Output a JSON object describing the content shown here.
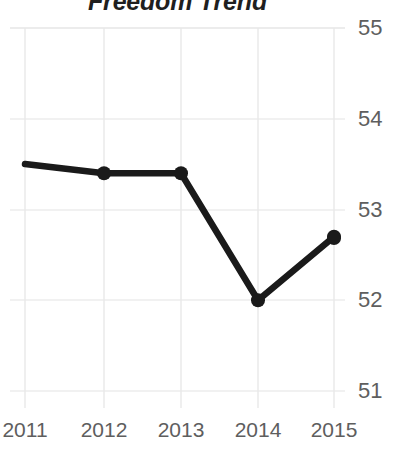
{
  "chart_data": {
    "type": "line",
    "title": "Freedom Trend",
    "xlabel": "",
    "ylabel": "",
    "categories": [
      "2011",
      "2012",
      "2013",
      "2014",
      "2015"
    ],
    "x": [
      2011,
      2012,
      2013,
      2014,
      2015
    ],
    "values": [
      53.5,
      53.4,
      53.4,
      52.0,
      52.7
    ],
    "series": [
      {
        "name": "Freedom Trend",
        "values": [
          53.5,
          53.4,
          53.4,
          52.0,
          52.7
        ]
      }
    ],
    "ylim": [
      51,
      55
    ],
    "yticks": [
      55,
      54,
      53,
      52,
      51
    ],
    "ytick_labels": [
      "55",
      "54",
      "53",
      "52",
      "51"
    ],
    "xticks": [
      2011,
      2012,
      2013,
      2014,
      2015
    ],
    "xtick_labels": [
      "2011",
      "2012",
      "2013",
      "2014",
      "2015"
    ],
    "grid": true,
    "grid_axes": "both",
    "legend": false,
    "legend_position": "none",
    "markers": true,
    "marker_shape": "circle",
    "line_color": "#1a1a1a",
    "marker_color": "#1a1a1a",
    "grid_color": "#e6e6e6",
    "tick_label_color": "#5e5e5e",
    "title_color": "#1f1f1f",
    "background_color": "#ffffff",
    "annotations": []
  },
  "axis": {
    "y_labels": [
      "55",
      "54",
      "53",
      "52",
      "51"
    ],
    "x_labels": [
      "2011",
      "2012",
      "2013",
      "2014",
      "2015"
    ]
  }
}
